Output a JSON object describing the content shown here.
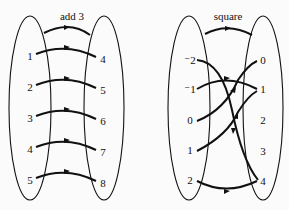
{
  "diagrams": [
    {
      "id": "add3",
      "title": "add 3",
      "domain": [
        "1",
        "2",
        "3",
        "4",
        "5"
      ],
      "codomain": [
        "4",
        "5",
        "6",
        "7",
        "8"
      ],
      "mapping": [
        [
          "1",
          "4"
        ],
        [
          "2",
          "5"
        ],
        [
          "3",
          "6"
        ],
        [
          "4",
          "7"
        ],
        [
          "5",
          "8"
        ]
      ]
    },
    {
      "id": "square",
      "title": "square",
      "domain": [
        "⁻2",
        "⁻1",
        "0",
        "1",
        "2"
      ],
      "codomain": [
        "0",
        "1",
        "2",
        "3",
        "4"
      ],
      "mapping": [
        [
          "⁻2",
          "4"
        ],
        [
          "⁻1",
          "1"
        ],
        [
          "0",
          "0"
        ],
        [
          "1",
          "1"
        ],
        [
          "2",
          "4"
        ]
      ]
    }
  ]
}
